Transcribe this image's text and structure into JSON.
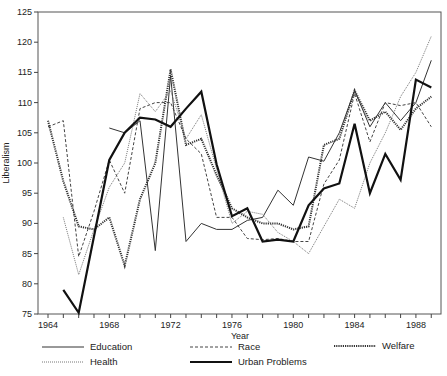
{
  "chart_data": {
    "type": "line",
    "title": "",
    "xlabel": "Year",
    "ylabel": "Liberalism",
    "xlim": [
      1963.4,
      1989.7
    ],
    "ylim": [
      75,
      125
    ],
    "yticks": [
      75,
      80,
      85,
      90,
      95,
      100,
      105,
      110,
      115,
      120,
      125
    ],
    "xtick_labels": [
      "1964",
      "1968",
      "1972",
      "1976",
      "1980",
      "1984",
      "1988"
    ],
    "grid": false,
    "legend_position": "bottom",
    "series": [
      {
        "name": "Education",
        "style": "solid-thin",
        "x": [
          1968,
          1969,
          1970,
          1971,
          1972,
          1973,
          1974,
          1975,
          1976,
          1977,
          1978,
          1979,
          1980,
          1981,
          1982,
          1983,
          1984,
          1985,
          1986,
          1987,
          1988,
          1989
        ],
        "values": [
          105.8,
          105,
          107,
          85.5,
          114.5,
          87,
          90,
          89,
          89,
          90.5,
          91,
          95.5,
          93,
          101,
          100.3,
          105,
          112,
          106,
          110,
          107,
          110,
          117
        ]
      },
      {
        "name": "Race",
        "style": "dashed",
        "x": [
          1964,
          1965,
          1966,
          1967,
          1968,
          1969,
          1970,
          1971,
          1972,
          1973,
          1974,
          1975,
          1976,
          1977,
          1978,
          1979,
          1980,
          1981,
          1982,
          1983,
          1984,
          1985,
          1986,
          1987,
          1988,
          1989
        ],
        "values": [
          106,
          107,
          84.5,
          92,
          100.5,
          95,
          109,
          110,
          110,
          104,
          101.5,
          91,
          91,
          87.5,
          87.3,
          87.5,
          87,
          87,
          96.5,
          100.5,
          111.5,
          103.5,
          110,
          109.5,
          110,
          106
        ]
      },
      {
        "name": "Welfare",
        "style": "dotted-heavy",
        "x": [
          1964,
          1965,
          1966,
          1967,
          1968,
          1969,
          1970,
          1971,
          1972,
          1973,
          1974,
          1975,
          1976,
          1977,
          1978,
          1979,
          1980,
          1981,
          1982,
          1983,
          1984,
          1985,
          1986,
          1987,
          1988,
          1989
        ],
        "values": [
          107,
          97,
          89.5,
          89,
          91,
          83,
          94,
          100,
          115.5,
          103,
          104,
          98,
          92.5,
          91,
          90,
          90,
          89,
          89.5,
          103,
          104,
          112,
          107,
          108.5,
          105.5,
          109,
          111
        ]
      },
      {
        "name": "Health",
        "style": "dotted-light",
        "x": [
          1965,
          1966,
          1967,
          1968,
          1969,
          1970,
          1971,
          1972,
          1973,
          1974,
          1975,
          1976,
          1977,
          1978,
          1979,
          1980,
          1981,
          1982,
          1983,
          1984,
          1985,
          1986,
          1987,
          1988,
          1989
        ],
        "values": [
          91,
          81.5,
          89,
          96,
          100,
          111.5,
          108.5,
          112,
          104,
          108,
          99,
          90,
          92,
          91.5,
          88.5,
          87,
          85,
          89.5,
          94,
          92.5,
          100,
          105,
          111,
          115,
          121
        ]
      },
      {
        "name": "Urban Problems",
        "style": "solid-heavy",
        "x": [
          1965,
          1966,
          1968,
          1969,
          1970,
          1971,
          1972,
          1973,
          1974,
          1975,
          1976,
          1977,
          1978,
          1979,
          1980,
          1981,
          1982,
          1983,
          1984,
          1985,
          1986,
          1987,
          1988,
          1989
        ],
        "values": [
          79,
          75.2,
          100.5,
          105,
          107.5,
          107.2,
          106,
          109,
          111.8,
          99.8,
          91.2,
          92.5,
          87,
          87.3,
          87,
          93,
          95.8,
          96.6,
          106.5,
          95,
          101.5,
          97.2,
          113.8,
          112.5
        ]
      }
    ]
  },
  "legend": {
    "items": [
      {
        "label": "Education"
      },
      {
        "label": "Race"
      },
      {
        "label": "Welfare"
      },
      {
        "label": "Health"
      },
      {
        "label": "Urban Problems"
      }
    ]
  }
}
